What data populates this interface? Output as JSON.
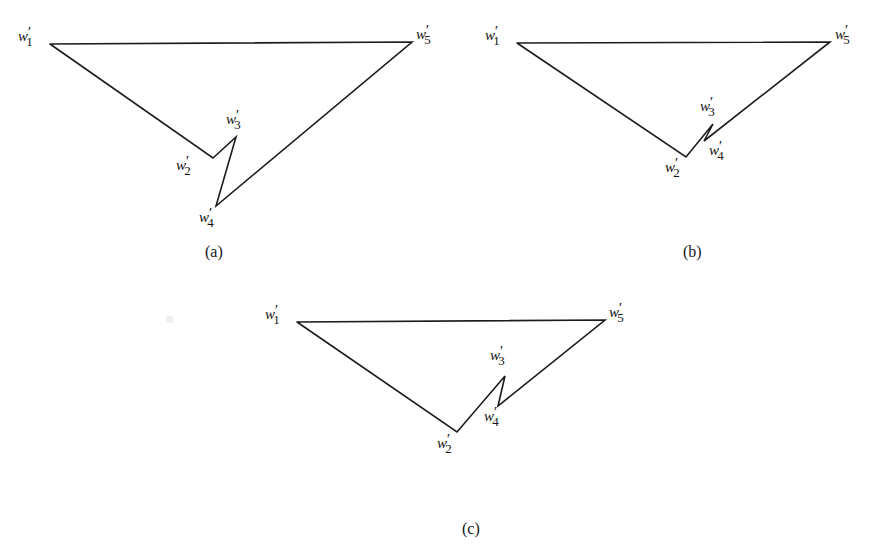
{
  "figure": {
    "background_color": "#ffffff",
    "stroke_color": "#1c1c1c",
    "panels": [
      {
        "id": "a",
        "caption": "(a)",
        "caption_x": 215,
        "caption_y": 243,
        "vertices": [
          {
            "name": "w1",
            "label_main": "w",
            "label_prime": "′",
            "label_sub": "1",
            "x": 50,
            "y": 44,
            "label_x": 18,
            "label_y": 29
          },
          {
            "name": "w2",
            "label_main": "w",
            "label_prime": "′",
            "label_sub": "2",
            "x": 213,
            "y": 158,
            "label_x": 176,
            "label_y": 158
          },
          {
            "name": "w3",
            "label_main": "w",
            "label_prime": "′",
            "label_sub": "3",
            "x": 236,
            "y": 137,
            "label_x": 226,
            "label_y": 112
          },
          {
            "name": "w4",
            "label_main": "w",
            "label_prime": "′",
            "label_sub": "4",
            "x": 216,
            "y": 206,
            "label_x": 199,
            "label_y": 210
          },
          {
            "name": "w5",
            "label_main": "w",
            "label_prime": "′",
            "label_sub": "5",
            "x": 412,
            "y": 42,
            "label_x": 416,
            "label_y": 27
          }
        ],
        "path": "M 50 44 L 412 42 L 216 206 L 236 137 L 213 158 L 50 44"
      },
      {
        "id": "b",
        "caption": "(b)",
        "caption_x": 693,
        "caption_y": 243,
        "vertices": [
          {
            "name": "w1",
            "label_main": "w",
            "label_prime": "′",
            "label_sub": "1",
            "x": 517,
            "y": 43,
            "label_x": 485,
            "label_y": 28
          },
          {
            "name": "w2",
            "label_main": "w",
            "label_prime": "′",
            "label_sub": "2",
            "x": 686,
            "y": 157,
            "label_x": 665,
            "label_y": 160
          },
          {
            "name": "w3",
            "label_main": "w",
            "label_prime": "′",
            "label_sub": "3",
            "x": 713,
            "y": 124,
            "label_x": 700,
            "label_y": 99
          },
          {
            "name": "w4",
            "label_main": "w",
            "label_prime": "′",
            "label_sub": "4",
            "x": 704,
            "y": 141,
            "label_x": 709,
            "label_y": 143
          },
          {
            "name": "w5",
            "label_main": "w",
            "label_prime": "′",
            "label_sub": "5",
            "x": 830,
            "y": 42,
            "label_x": 835,
            "label_y": 27
          }
        ],
        "path": "M 517 43 L 830 42 L 704 141 L 713 124 L 686 157 L 517 43"
      },
      {
        "id": "c",
        "caption": "(c)",
        "caption_x": 472,
        "caption_y": 520,
        "vertices": [
          {
            "name": "w1",
            "label_main": "w",
            "label_prime": "′",
            "label_sub": "1",
            "x": 297,
            "y": 322,
            "label_x": 265,
            "label_y": 307
          },
          {
            "name": "w2",
            "label_main": "w",
            "label_prime": "′",
            "label_sub": "2",
            "x": 457,
            "y": 432,
            "label_x": 437,
            "label_y": 436
          },
          {
            "name": "w3",
            "label_main": "w",
            "label_prime": "′",
            "label_sub": "3",
            "x": 505,
            "y": 376,
            "label_x": 490,
            "label_y": 348
          },
          {
            "name": "w4",
            "label_main": "w",
            "label_prime": "′",
            "label_sub": "4",
            "x": 498,
            "y": 406,
            "label_x": 484,
            "label_y": 409
          },
          {
            "name": "w5",
            "label_main": "w",
            "label_prime": "′",
            "label_sub": "5",
            "x": 605,
            "y": 320,
            "label_x": 609,
            "label_y": 305
          }
        ],
        "path": "M 297 322 L 605 320 L 498 406 L 505 376 L 457 432 L 297 322"
      }
    ],
    "artifacts": [
      {
        "name": "scan-speck",
        "x": 166,
        "y": 316
      }
    ]
  }
}
